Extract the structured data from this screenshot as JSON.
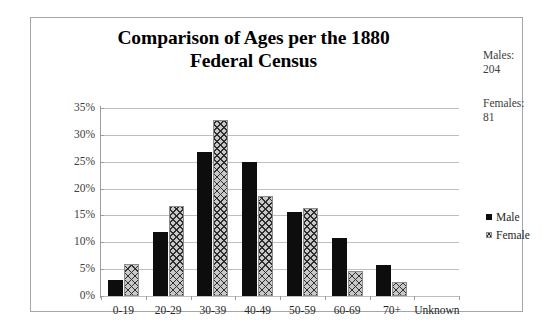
{
  "chart_data": {
    "type": "bar",
    "title": "Comparison of Ages per the 1880 Federal Census",
    "title_line1": "Comparison of Ages per the 1880",
    "title_line2": "Federal Census",
    "xlabel": "",
    "ylabel": "",
    "categories": [
      "0-19",
      "20-29",
      "30-39",
      "40-49",
      "50-59",
      "60-69",
      "70+",
      "Unknown"
    ],
    "series": [
      {
        "name": "Male",
        "values": [
          3.0,
          12.0,
          26.8,
          24.9,
          15.7,
          10.8,
          5.7,
          0
        ]
      },
      {
        "name": "Female",
        "values": [
          5.9,
          16.7,
          32.8,
          18.7,
          16.4,
          4.7,
          2.7,
          0
        ]
      }
    ],
    "ylim": [
      0,
      35
    ],
    "ytick_values": [
      0,
      5,
      10,
      15,
      20,
      25,
      30,
      35
    ],
    "ytick_labels": [
      "0%",
      "5%",
      "10%",
      "15%",
      "20%",
      "25%",
      "30%",
      "35%"
    ],
    "grid": true,
    "legend_position": "right",
    "colors": {
      "male": "#0d0d0d",
      "female": "#c9c9c9",
      "gridline": "#bfbfbf",
      "axis": "#9c9c9c",
      "border": "#a6a6a6",
      "text": "#262626"
    }
  },
  "annotations": {
    "males_label": "Males:",
    "males_count": "204",
    "females_label": "Females:",
    "females_count": "81"
  },
  "legend": {
    "items": [
      {
        "label": "Male",
        "marker": "solid-square-marker"
      },
      {
        "label": "Female",
        "marker": "crosshatch-square-marker"
      }
    ]
  }
}
